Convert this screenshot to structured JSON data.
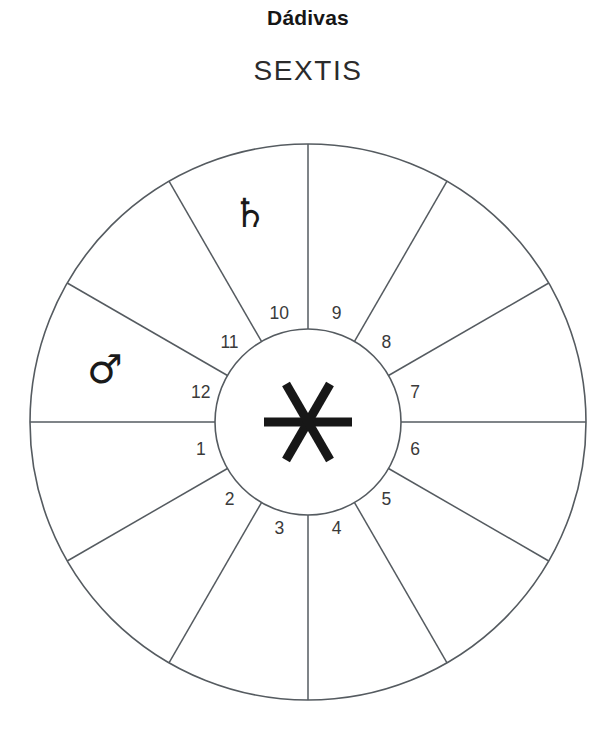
{
  "header": {
    "title": "Dádivas",
    "subtitle": "SEXTIS"
  },
  "chart": {
    "type": "astrological-house-wheel",
    "center_aspect": {
      "name": "sextile-symbol",
      "glyph": "✳",
      "label": "SEXTIS"
    },
    "geometry": {
      "center_x": 308,
      "center_y": 422,
      "outer_radius": 278,
      "inner_radius": 93,
      "spoke_count": 12,
      "spoke_step_degrees": 30
    },
    "colors": {
      "line": "#555b60",
      "glyph": "#1a1a1a",
      "number": "#3a3a3a",
      "background": "#ffffff"
    },
    "houses": [
      {
        "number": "1",
        "angle_deg": 195
      },
      {
        "number": "2",
        "angle_deg": 225
      },
      {
        "number": "3",
        "angle_deg": 255
      },
      {
        "number": "4",
        "angle_deg": 285
      },
      {
        "number": "5",
        "angle_deg": 315
      },
      {
        "number": "6",
        "angle_deg": 345
      },
      {
        "number": "7",
        "angle_deg": 15
      },
      {
        "number": "8",
        "angle_deg": 45
      },
      {
        "number": "9",
        "angle_deg": 75
      },
      {
        "number": "10",
        "angle_deg": 105
      },
      {
        "number": "11",
        "angle_deg": 135
      },
      {
        "number": "12",
        "angle_deg": 165
      }
    ],
    "planets": [
      {
        "name": "saturn",
        "glyph": "♄",
        "x": 250,
        "y": 216
      },
      {
        "name": "mars",
        "glyph": "♂",
        "x": 105,
        "y": 372
      }
    ]
  }
}
